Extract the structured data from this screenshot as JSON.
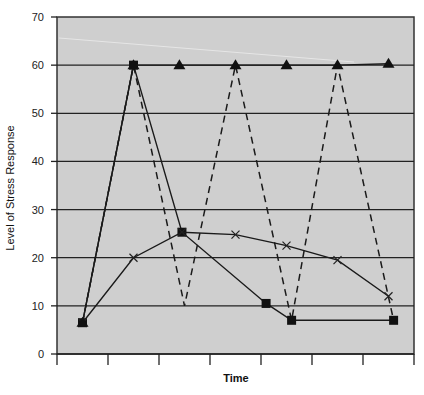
{
  "chart_data": {
    "type": "line",
    "title": "",
    "xlabel": "Time",
    "ylabel": "Level of Stress Response",
    "ylim": [
      0,
      70
    ],
    "yticks": [
      0,
      10,
      20,
      30,
      40,
      50,
      60,
      70
    ],
    "x_tick_count": 8,
    "x_tick_labels": [],
    "grid": true,
    "legend": null,
    "plot_background": "#cfcfcf",
    "x": [
      0.5,
      1.5,
      2.4,
      3.5,
      4.1,
      4.5,
      5.5,
      6.6
    ],
    "series": [
      {
        "name": "triangle-series",
        "style": "solid",
        "marker": "triangle",
        "points": [
          [
            0.5,
            6.5
          ],
          [
            1.5,
            60
          ],
          [
            2.4,
            60
          ],
          [
            3.5,
            60
          ],
          [
            4.5,
            60
          ],
          [
            5.5,
            60
          ],
          [
            6.5,
            60.3
          ]
        ]
      },
      {
        "name": "square-series",
        "style": "solid",
        "marker": "square",
        "points": [
          [
            0.5,
            6.5
          ],
          [
            1.5,
            60
          ],
          [
            2.45,
            25.3
          ],
          [
            4.1,
            10.5
          ],
          [
            4.6,
            7
          ],
          [
            6.6,
            7
          ]
        ]
      },
      {
        "name": "x-series",
        "style": "solid",
        "marker": "x",
        "points": [
          [
            0.5,
            6.5
          ],
          [
            1.5,
            20
          ],
          [
            2.45,
            25.3
          ],
          [
            3.5,
            24.8
          ],
          [
            4.5,
            22.5
          ],
          [
            5.5,
            19.5
          ],
          [
            6.5,
            12
          ]
        ]
      },
      {
        "name": "dashed-series",
        "style": "dashed",
        "marker": "none",
        "points": [
          [
            0.5,
            6.5
          ],
          [
            1.5,
            60
          ],
          [
            2.5,
            10
          ],
          [
            3.5,
            60
          ],
          [
            4.6,
            7
          ],
          [
            5.5,
            60
          ],
          [
            6.6,
            7
          ]
        ]
      }
    ]
  },
  "labels": {
    "xlabel": "Time",
    "ylabel": "Level of Stress Response",
    "yticks": [
      "0",
      "10",
      "20",
      "30",
      "40",
      "50",
      "60",
      "70"
    ]
  }
}
